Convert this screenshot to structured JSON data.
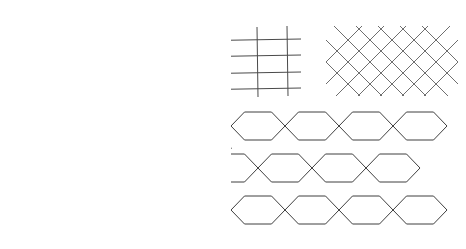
{
  "figure": {
    "background_color": "#ffffff",
    "line_color": "#4a4a4a",
    "width": 466,
    "height": 249,
    "panel_count": 5
  },
  "panels": [
    {
      "id": "square-grid-left",
      "label": "Square grid",
      "type": "orthogonal-grid",
      "vertical_line_count": 5,
      "horizontal_line_count": 4,
      "bounds": {
        "x": 18,
        "y": 8,
        "width": 96,
        "height": 96
      },
      "tilt_degrees": 1.2
    },
    {
      "id": "rectangular-grid-middle",
      "label": "Rectangular grid",
      "type": "orthogonal-grid",
      "vertical_line_count": 4,
      "horizontal_line_count": 4,
      "bounds": {
        "x": 183,
        "y": 26,
        "width": 115,
        "height": 72
      },
      "tilt_degrees": 0.8
    },
    {
      "id": "diamond-lattice-right",
      "label": "Diamond lattice",
      "type": "diagonal-lattice",
      "down_diagonal_count": 7,
      "up_diagonal_count": 7,
      "bounds": {
        "x": 326,
        "y": 22,
        "width": 132,
        "height": 74
      },
      "cell_pitch": 22
    },
    {
      "id": "radial-circles",
      "label": "Concentric circles with rays",
      "type": "radial",
      "center": {
        "x": 148,
        "y": 185
      },
      "outer_radius": 46,
      "inner_radius": 20,
      "ray_count": 5,
      "ray_angles_degrees": [
        90,
        66,
        51,
        27,
        0
      ],
      "ray_lengths": [
        64,
        74,
        86,
        94,
        80
      ]
    },
    {
      "id": "hexagonal-tiling",
      "label": "Hexagonal honeycomb tiling",
      "type": "hex-tiling",
      "orientation": "flat-top",
      "rows": 3,
      "columns": 4,
      "hex_radius": 27,
      "origin": {
        "x": 258,
        "y": 143
      },
      "bounds": {
        "x": 231,
        "y": 112,
        "width": 182,
        "height": 126
      }
    }
  ]
}
